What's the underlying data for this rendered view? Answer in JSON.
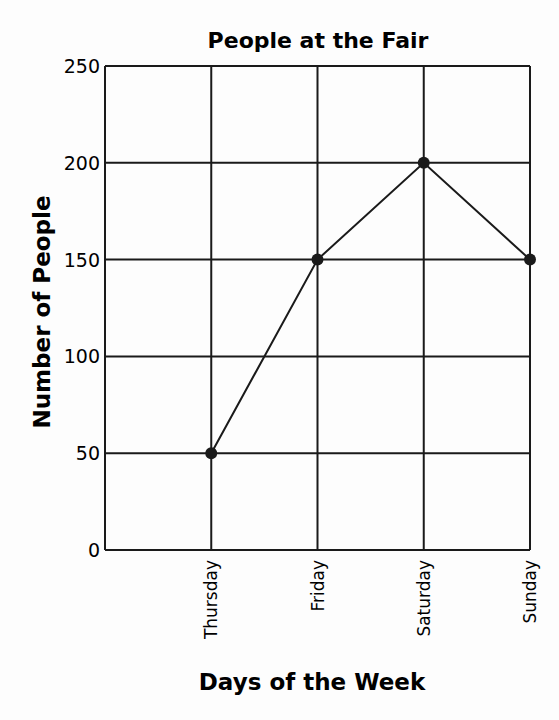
{
  "chart_data": {
    "type": "line",
    "title": "People at the Fair",
    "xlabel": "Days of the Week",
    "ylabel": "Number of People",
    "categories": [
      "Thursday",
      "Friday",
      "Saturday",
      "Sunday"
    ],
    "series": [
      {
        "name": "People",
        "values": [
          50,
          150,
          200,
          150
        ]
      }
    ],
    "yticks": [
      0,
      50,
      100,
      150,
      200,
      250
    ],
    "ylim": [
      0,
      250
    ],
    "grid": true,
    "legend": "none",
    "markers": "filled-circle",
    "line_color": "#1a1a1a"
  }
}
